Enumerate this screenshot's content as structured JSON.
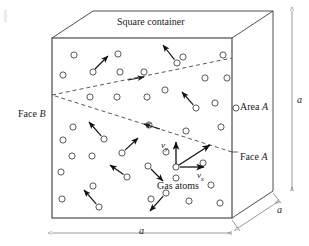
{
  "figure": {
    "colors": {
      "line": "#3b3b3b",
      "atom_stroke": "#3b3b3b",
      "arrow": "#111111",
      "dashed": "#3b3b3b",
      "dimension": "#6e6e6e",
      "text": "#1a1a1a",
      "background": "#ffffff"
    }
  },
  "labels": {
    "square_container": "Square container",
    "face_b": "Face B",
    "face_a": "Face A",
    "area_a": "Area A",
    "gas_atoms": "Gas atoms",
    "dim_width": "a",
    "dim_height": "a",
    "dim_depth": "a",
    "velocity_y": "v",
    "velocity_y_sub": "y",
    "velocity_x": "v",
    "velocity_x_sub": "x"
  },
  "geometry": {
    "front_face": {
      "left": 52,
      "top": 38,
      "right": 232,
      "bottom": 218
    },
    "depth_offset": {
      "dx": 41,
      "dy": -27
    },
    "note": "oblique projection cube"
  },
  "chart_data": {
    "type": "diagram",
    "title": "Square container",
    "atoms": [
      {
        "cx": 74,
        "cy": 55
      },
      {
        "cx": 118,
        "cy": 54
      },
      {
        "cx": 183,
        "cy": 57
      },
      {
        "cx": 223,
        "cy": 55
      },
      {
        "cx": 63,
        "cy": 75
      },
      {
        "cx": 93,
        "cy": 72
      },
      {
        "cx": 120,
        "cy": 72
      },
      {
        "cx": 144,
        "cy": 72
      },
      {
        "cx": 177,
        "cy": 63
      },
      {
        "cx": 205,
        "cy": 78
      },
      {
        "cx": 227,
        "cy": 78
      },
      {
        "cx": 90,
        "cy": 97
      },
      {
        "cx": 117,
        "cy": 97
      },
      {
        "cx": 147,
        "cy": 97
      },
      {
        "cx": 165,
        "cy": 90
      },
      {
        "cx": 196,
        "cy": 108
      },
      {
        "cx": 215,
        "cy": 103
      },
      {
        "cx": 236,
        "cy": 108
      },
      {
        "cx": 73,
        "cy": 127
      },
      {
        "cx": 149,
        "cy": 125
      },
      {
        "cx": 104,
        "cy": 139
      },
      {
        "cx": 63,
        "cy": 140
      },
      {
        "cx": 186,
        "cy": 131
      },
      {
        "cx": 221,
        "cy": 127
      },
      {
        "cx": 72,
        "cy": 156
      },
      {
        "cx": 92,
        "cy": 156
      },
      {
        "cx": 122,
        "cy": 153
      },
      {
        "cx": 166,
        "cy": 152
      },
      {
        "cx": 61,
        "cy": 172
      },
      {
        "cx": 148,
        "cy": 166
      },
      {
        "cx": 203,
        "cy": 163
      },
      {
        "cx": 176,
        "cy": 178
      },
      {
        "cx": 93,
        "cy": 186
      },
      {
        "cx": 127,
        "cy": 177
      },
      {
        "cx": 166,
        "cy": 193
      },
      {
        "cx": 211,
        "cy": 185
      },
      {
        "cx": 62,
        "cy": 199
      },
      {
        "cx": 151,
        "cy": 199
      },
      {
        "cx": 189,
        "cy": 201
      },
      {
        "cx": 99,
        "cy": 207
      },
      {
        "cx": 220,
        "cy": 203
      }
    ],
    "velocity_arrows": [
      {
        "x1": 92,
        "y1": 72,
        "x2": 108,
        "y2": 56
      },
      {
        "x1": 177,
        "y1": 63,
        "x2": 163,
        "y2": 45
      },
      {
        "x1": 196,
        "y1": 108,
        "x2": 182,
        "y2": 92
      },
      {
        "x1": 104,
        "y1": 139,
        "x2": 89,
        "y2": 122
      },
      {
        "x1": 122,
        "y1": 153,
        "x2": 138,
        "y2": 138
      },
      {
        "x1": 148,
        "y1": 166,
        "x2": 163,
        "y2": 181
      },
      {
        "x1": 127,
        "y1": 177,
        "x2": 110,
        "y2": 165
      },
      {
        "x1": 99,
        "y1": 207,
        "x2": 84,
        "y2": 190
      },
      {
        "x1": 166,
        "y1": 193,
        "x2": 150,
        "y2": 211
      }
    ],
    "dashed_path": [
      {
        "x": 232,
        "y": 152
      },
      {
        "x": 52,
        "y": 95
      },
      {
        "x": 232,
        "y": 58
      }
    ],
    "velocity_origin": {
      "x": 176,
      "y": 167
    },
    "velocity_components": {
      "vy": {
        "x": 176,
        "y": 141
      },
      "vx": {
        "x": 206,
        "y": 167
      },
      "resultant": {
        "x": 212,
        "y": 143
      }
    }
  }
}
